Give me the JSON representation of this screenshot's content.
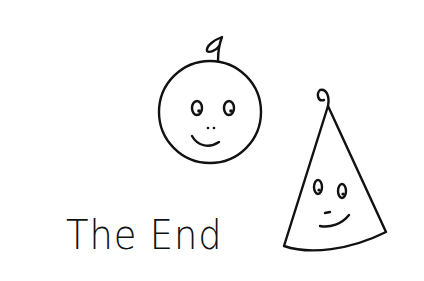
{
  "illustration": {
    "caption": "The End",
    "figures": [
      {
        "name": "round-face",
        "shape": "circle",
        "features": [
          "stem-loop",
          "two-eyes",
          "nose-dots",
          "smile"
        ]
      },
      {
        "name": "cone-face",
        "shape": "cone",
        "features": [
          "curl-loop",
          "two-eyes",
          "nose-dash",
          "smile"
        ]
      }
    ],
    "ink_color": "#111111",
    "background": "#ffffff"
  }
}
